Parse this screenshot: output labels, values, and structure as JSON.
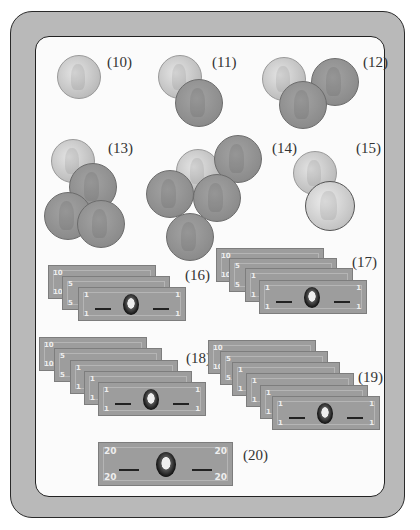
{
  "worksheet": {
    "colors": {
      "frame": "#b9b9b9",
      "panel": "#fbfbfb",
      "coin_silver": "#c8c8c8",
      "coin_penny": "#8c8c8c",
      "bill": "#9d9d9d"
    },
    "problems": [
      {
        "label": "(10)",
        "items": [
          "dime"
        ]
      },
      {
        "label": "(11)",
        "items": [
          "dime",
          "penny"
        ]
      },
      {
        "label": "(12)",
        "items": [
          "dime",
          "penny",
          "penny"
        ]
      },
      {
        "label": "(13)",
        "items": [
          "dime",
          "penny",
          "penny",
          "penny"
        ]
      },
      {
        "label": "(14)",
        "items": [
          "dime",
          "penny",
          "penny",
          "penny",
          "penny"
        ]
      },
      {
        "label": "(15)",
        "items": [
          "dime",
          "nickel"
        ]
      },
      {
        "label": "(16)",
        "items": [
          "$10 bill",
          "$5 bill",
          "$1 bill"
        ]
      },
      {
        "label": "(17)",
        "items": [
          "$10 bill",
          "$5 bill",
          "$1 bill",
          "$1 bill"
        ]
      },
      {
        "label": "(18)",
        "items": [
          "$10 bill",
          "$5 bill",
          "$1 bill",
          "$1 bill",
          "$1 bill"
        ]
      },
      {
        "label": "(19)",
        "items": [
          "$10 bill",
          "$5 bill",
          "$1 bill",
          "$1 bill",
          "$1 bill",
          "$1 bill"
        ]
      },
      {
        "label": "(20)",
        "items": [
          "$20 bill"
        ]
      }
    ],
    "denominations": {
      "ten": "10",
      "five": "5",
      "one": "1",
      "twenty": "20"
    }
  }
}
